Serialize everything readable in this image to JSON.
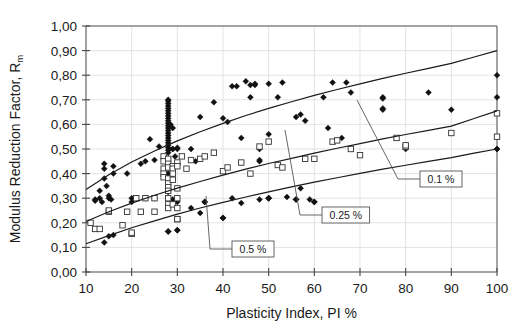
{
  "chart_data": {
    "type": "scatter",
    "title": "",
    "xlabel": "Plasticity Index, PI %",
    "ylabel_main": "Modulus Reduction Factor, R",
    "ylabel_sub": "m",
    "xlim": [
      10,
      100
    ],
    "ylim": [
      0.0,
      1.0
    ],
    "grid": true,
    "legend_position": "inline-callouts",
    "xticks": [
      "10",
      "20",
      "30",
      "40",
      "50",
      "60",
      "70",
      "80",
      "90",
      "100"
    ],
    "xtick_values": [
      10,
      20,
      30,
      40,
      50,
      60,
      70,
      80,
      90,
      100
    ],
    "yticks": [
      "0,00",
      "0,10",
      "0,20",
      "0,30",
      "0,40",
      "0,50",
      "0,60",
      "0,70",
      "0,80",
      "0,90",
      "1,00"
    ],
    "ytick_values": [
      0.0,
      0.1,
      0.2,
      0.3,
      0.4,
      0.5,
      0.6,
      0.7,
      0.8,
      0.9,
      1.0
    ],
    "annotations": [
      {
        "label": "0.1 %",
        "curve": "upper",
        "box_x": 420,
        "box_y": 171,
        "anchor_x": 357,
        "anchor_y": 100
      },
      {
        "label": "0.25 %",
        "curve": "middle",
        "box_x": 322,
        "box_y": 207,
        "anchor_x": 285,
        "anchor_y": 130
      },
      {
        "label": "0.5 %",
        "curve": "lower",
        "box_x": 232,
        "box_y": 241,
        "anchor_x": 206,
        "anchor_y": 196
      }
    ],
    "series": [
      {
        "name": "0.1 %",
        "marker": "filled-diamond",
        "curve_label": "upper",
        "curve_points": [
          [
            10,
            0.335
          ],
          [
            15,
            0.395
          ],
          [
            20,
            0.447
          ],
          [
            25,
            0.492
          ],
          [
            30,
            0.533
          ],
          [
            35,
            0.57
          ],
          [
            40,
            0.604
          ],
          [
            45,
            0.636
          ],
          [
            50,
            0.665
          ],
          [
            55,
            0.692
          ],
          [
            60,
            0.718
          ],
          [
            65,
            0.742
          ],
          [
            70,
            0.765
          ],
          [
            75,
            0.787
          ],
          [
            80,
            0.808
          ],
          [
            85,
            0.828
          ],
          [
            90,
            0.848
          ],
          [
            95,
            0.874
          ],
          [
            100,
            0.9
          ]
        ],
        "points": [
          [
            12,
            0.29
          ],
          [
            12,
            0.295
          ],
          [
            13,
            0.3
          ],
          [
            13,
            0.33
          ],
          [
            13.5,
            0.285
          ],
          [
            14,
            0.42
          ],
          [
            14,
            0.44
          ],
          [
            14,
            0.38
          ],
          [
            14.5,
            0.35
          ],
          [
            15,
            0.31
          ],
          [
            15,
            0.3
          ],
          [
            15.5,
            0.295
          ],
          [
            16,
            0.43
          ],
          [
            16,
            0.4
          ],
          [
            19,
            0.4
          ],
          [
            20,
            0.3
          ],
          [
            20,
            0.285
          ],
          [
            22,
            0.44
          ],
          [
            23,
            0.45
          ],
          [
            23,
            0.3
          ],
          [
            24,
            0.54
          ],
          [
            25,
            0.3
          ],
          [
            25,
            0.455
          ],
          [
            26,
            0.51
          ],
          [
            27,
            0.46
          ],
          [
            28,
            0.7
          ],
          [
            28,
            0.695
          ],
          [
            28,
            0.685
          ],
          [
            28,
            0.675
          ],
          [
            28,
            0.665
          ],
          [
            28,
            0.655
          ],
          [
            28,
            0.645
          ],
          [
            28,
            0.635
          ],
          [
            28,
            0.625
          ],
          [
            28,
            0.615
          ],
          [
            28,
            0.605
          ],
          [
            28,
            0.595
          ],
          [
            28,
            0.585
          ],
          [
            28,
            0.575
          ],
          [
            28,
            0.565
          ],
          [
            28,
            0.555
          ],
          [
            28,
            0.545
          ],
          [
            28,
            0.535
          ],
          [
            28,
            0.525
          ],
          [
            28,
            0.515
          ],
          [
            28,
            0.505
          ],
          [
            28,
            0.495
          ],
          [
            28,
            0.485
          ],
          [
            28,
            0.46
          ],
          [
            28,
            0.44
          ],
          [
            28,
            0.43
          ],
          [
            28,
            0.4
          ],
          [
            28,
            0.385
          ],
          [
            28,
            0.34
          ],
          [
            28,
            0.325
          ],
          [
            28.5,
            0.6
          ],
          [
            29,
            0.585
          ],
          [
            29,
            0.5
          ],
          [
            29,
            0.5
          ],
          [
            29.5,
            0.47
          ],
          [
            29,
            0.295
          ],
          [
            30,
            0.285
          ],
          [
            30,
            0.44
          ],
          [
            30,
            0.5
          ],
          [
            30,
            0.505
          ],
          [
            30,
            0.17
          ],
          [
            28,
            0.165
          ],
          [
            33,
            0.5
          ],
          [
            34,
            0.45
          ],
          [
            35,
            0.63
          ],
          [
            36,
            0.285
          ],
          [
            38,
            0.69
          ],
          [
            40,
            0.22
          ],
          [
            40,
            0.625
          ],
          [
            41,
            0.61
          ],
          [
            42,
            0.755
          ],
          [
            43,
            0.755
          ],
          [
            44,
            0.545
          ],
          [
            45,
            0.775
          ],
          [
            46,
            0.71
          ],
          [
            46,
            0.76
          ],
          [
            47,
            0.765
          ],
          [
            47,
            0.76
          ],
          [
            48,
            0.5
          ],
          [
            48,
            0.45
          ],
          [
            48,
            0.455
          ],
          [
            50,
            0.765
          ],
          [
            50,
            0.56
          ],
          [
            50,
            0.3
          ],
          [
            50,
            0.3
          ],
          [
            52,
            0.71
          ],
          [
            53,
            0.77
          ],
          [
            54,
            0.305
          ],
          [
            56,
            0.63
          ],
          [
            56,
            0.295
          ],
          [
            57,
            0.64
          ],
          [
            58,
            0.615
          ],
          [
            59,
            0.295
          ],
          [
            60,
            0.285
          ],
          [
            62,
            0.71
          ],
          [
            63,
            0.585
          ],
          [
            64,
            0.77
          ],
          [
            66,
            0.545
          ],
          [
            67,
            0.77
          ],
          [
            68,
            0.73
          ],
          [
            75,
            0.71
          ],
          [
            75,
            0.705
          ],
          [
            75,
            0.665
          ],
          [
            75,
            0.66
          ],
          [
            80,
            0.5
          ],
          [
            85,
            0.73
          ],
          [
            90,
            0.66
          ],
          [
            100,
            0.8
          ],
          [
            100,
            0.71
          ],
          [
            100,
            0.5
          ]
        ]
      },
      {
        "name": "0.25 %",
        "marker": "open-square",
        "curve_label": "middle",
        "curve_points": [
          [
            10,
            0.205
          ],
          [
            15,
            0.245
          ],
          [
            20,
            0.28
          ],
          [
            25,
            0.312
          ],
          [
            30,
            0.341
          ],
          [
            35,
            0.368
          ],
          [
            40,
            0.394
          ],
          [
            45,
            0.418
          ],
          [
            50,
            0.441
          ],
          [
            55,
            0.462
          ],
          [
            60,
            0.483
          ],
          [
            65,
            0.503
          ],
          [
            70,
            0.522
          ],
          [
            75,
            0.541
          ],
          [
            80,
            0.559
          ],
          [
            85,
            0.576
          ],
          [
            90,
            0.593
          ],
          [
            95,
            0.624
          ],
          [
            100,
            0.655
          ]
        ],
        "points": [
          [
            11,
            0.2
          ],
          [
            12,
            0.175
          ],
          [
            13,
            0.175
          ],
          [
            15,
            0.245
          ],
          [
            15,
            0.25
          ],
          [
            18,
            0.19
          ],
          [
            19,
            0.245
          ],
          [
            20,
            0.155
          ],
          [
            20,
            0.16
          ],
          [
            21,
            0.3
          ],
          [
            22,
            0.245
          ],
          [
            23,
            0.3
          ],
          [
            25,
            0.245
          ],
          [
            25,
            0.3
          ],
          [
            27,
            0.47
          ],
          [
            27,
            0.45
          ],
          [
            27,
            0.42
          ],
          [
            27,
            0.4
          ],
          [
            27,
            0.385
          ],
          [
            28,
            0.46
          ],
          [
            28,
            0.44
          ],
          [
            28,
            0.425
          ],
          [
            28,
            0.38
          ],
          [
            28,
            0.36
          ],
          [
            28,
            0.345
          ],
          [
            28,
            0.33
          ],
          [
            28,
            0.3
          ],
          [
            28,
            0.275
          ],
          [
            28,
            0.26
          ],
          [
            29,
            0.43
          ],
          [
            29,
            0.42
          ],
          [
            29,
            0.4
          ],
          [
            29,
            0.375
          ],
          [
            29,
            0.275
          ],
          [
            30,
            0.445
          ],
          [
            30,
            0.43
          ],
          [
            30,
            0.34
          ],
          [
            30,
            0.3
          ],
          [
            30,
            0.26
          ],
          [
            30,
            0.215
          ],
          [
            30,
            0.215
          ],
          [
            31,
            0.47
          ],
          [
            32,
            0.42
          ],
          [
            33,
            0.455
          ],
          [
            35,
            0.46
          ],
          [
            36,
            0.47
          ],
          [
            38,
            0.485
          ],
          [
            40,
            0.41
          ],
          [
            41,
            0.425
          ],
          [
            44,
            0.445
          ],
          [
            46,
            0.4
          ],
          [
            48,
            0.51
          ],
          [
            50,
            0.53
          ],
          [
            52,
            0.435
          ],
          [
            53,
            0.425
          ],
          [
            58,
            0.46
          ],
          [
            60,
            0.46
          ],
          [
            64,
            0.53
          ],
          [
            65,
            0.535
          ],
          [
            68,
            0.5
          ],
          [
            70,
            0.475
          ],
          [
            78,
            0.545
          ],
          [
            80,
            0.51
          ],
          [
            80,
            0.515
          ],
          [
            90,
            0.565
          ],
          [
            100,
            0.645
          ],
          [
            100,
            0.55
          ]
        ]
      },
      {
        "name": "0.5 %",
        "marker": "filled-diamond",
        "curve_label": "lower",
        "curve_points": [
          [
            10,
            0.115
          ],
          [
            15,
            0.148
          ],
          [
            20,
            0.18
          ],
          [
            25,
            0.208
          ],
          [
            30,
            0.235
          ],
          [
            35,
            0.26
          ],
          [
            40,
            0.283
          ],
          [
            45,
            0.305
          ],
          [
            50,
            0.326
          ],
          [
            55,
            0.346
          ],
          [
            60,
            0.365
          ],
          [
            65,
            0.383
          ],
          [
            70,
            0.401
          ],
          [
            75,
            0.418
          ],
          [
            80,
            0.434
          ],
          [
            85,
            0.45
          ],
          [
            90,
            0.465
          ],
          [
            95,
            0.483
          ],
          [
            100,
            0.5
          ]
        ],
        "points": [
          [
            14,
            0.12
          ],
          [
            15,
            0.145
          ],
          [
            16,
            0.15
          ],
          [
            28,
            0.165
          ],
          [
            30,
            0.17
          ],
          [
            33,
            0.26
          ],
          [
            35,
            0.24
          ],
          [
            36,
            0.285
          ],
          [
            40,
            0.22
          ],
          [
            42,
            0.3
          ],
          [
            44,
            0.28
          ],
          [
            48,
            0.295
          ],
          [
            50,
            0.3
          ],
          [
            56,
            0.295
          ],
          [
            57,
            0.34
          ],
          [
            60,
            0.285
          ],
          [
            100,
            0.5
          ]
        ]
      }
    ]
  }
}
